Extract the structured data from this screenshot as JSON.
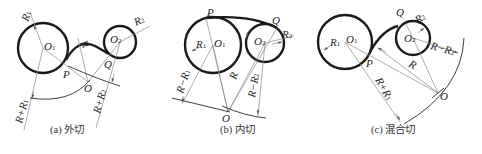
{
  "figure": {
    "panels": [
      {
        "id": "a",
        "caption": "(a) 外切",
        "labels": {
          "O1": "O",
          "O1_sub": "1",
          "O2": "O",
          "O2_sub": "2",
          "O": "O",
          "P": "P",
          "Q": "Q",
          "R": "R",
          "R1": "R",
          "R1_sub": "1",
          "R2": "R",
          "R2_sub": "2",
          "RpR1": "R+R",
          "RpR1_sub": "1",
          "RpR2": "R+R",
          "RpR2_sub": "2"
        }
      },
      {
        "id": "b",
        "caption": "(b) 内切",
        "labels": {
          "O1": "O",
          "O1_sub": "1",
          "O2": "O",
          "O2_sub": "2",
          "O": "O",
          "P": "P",
          "Q": "Q",
          "R": "R",
          "R1": "R",
          "R1_sub": "1",
          "R2": "R",
          "R2_sub": "2",
          "RmR1": "R−R",
          "RmR1_sub": "1",
          "RmR2": "R−R",
          "RmR2_sub": "2"
        }
      },
      {
        "id": "c",
        "caption": "(c) 混合切",
        "labels": {
          "O1": "O",
          "O1_sub": "1",
          "O2": "O",
          "O2_sub": "2",
          "O": "O",
          "P": "P",
          "Q": "Q",
          "R": "R",
          "R1": "R",
          "R1_sub": "1",
          "R2": "R",
          "R2_sub": "2",
          "RpR1": "R+R",
          "RpR1_sub": "1",
          "RmR2": "R−R",
          "RmR2_sub": "2"
        }
      }
    ]
  }
}
